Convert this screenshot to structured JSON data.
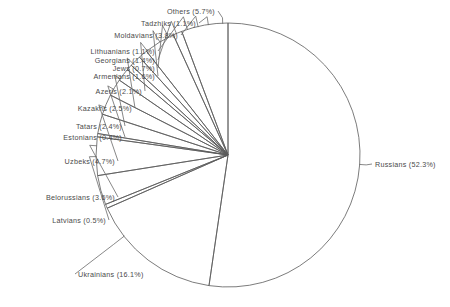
{
  "chart_data": {
    "type": "pie",
    "title": "",
    "subtitle": "",
    "xlabel": "",
    "ylabel": "",
    "legend_position": "none",
    "grid": false,
    "value_unit": "percent",
    "start_angle_deg": 0,
    "direction": "clockwise",
    "total": 100.0,
    "categories": [
      "Russians",
      "Ukrainians",
      "Latvians",
      "Belorussians",
      "Uzbeks",
      "Estonians",
      "Tatars",
      "Kazakhs",
      "Azeris",
      "Armenians",
      "Jews",
      "Georgians",
      "Lithuanians",
      "Moldavians",
      "Tadzhiks",
      "Others"
    ],
    "values": [
      52.3,
      16.1,
      0.5,
      3.6,
      4.7,
      0.4,
      2.4,
      2.5,
      2.1,
      1.6,
      0.7,
      1.4,
      1.1,
      3.8,
      1.1,
      5.7
    ],
    "slices": [
      {
        "label": "Russians",
        "value": 52.3,
        "label_text": "Russians (52.3%)"
      },
      {
        "label": "Ukrainians",
        "value": 16.1,
        "label_text": "Ukrainians (16.1%)"
      },
      {
        "label": "Latvians",
        "value": 0.5,
        "label_text": "Latvians (0.5%)"
      },
      {
        "label": "Belorussians",
        "value": 3.6,
        "label_text": "Belorussians (3.6%)"
      },
      {
        "label": "Uzbeks",
        "value": 4.7,
        "label_text": "Uzbeks (4.7%)"
      },
      {
        "label": "Estonians",
        "value": 0.4,
        "label_text": "Estonians (0.4%)"
      },
      {
        "label": "Tatars",
        "value": 2.4,
        "label_text": "Tatars (2.4%)"
      },
      {
        "label": "Kazakhs",
        "value": 2.5,
        "label_text": "Kazakhs (2.5%)"
      },
      {
        "label": "Azeris",
        "value": 2.1,
        "label_text": "Azeris (2.1%)"
      },
      {
        "label": "Armenians",
        "value": 1.6,
        "label_text": "Armenians (1.6%)"
      },
      {
        "label": "Jews",
        "value": 0.7,
        "label_text": "Jews (0.7%)"
      },
      {
        "label": "Georgians",
        "value": 1.4,
        "label_text": "Georgians (1.4%)"
      },
      {
        "label": "Lithuanians",
        "value": 1.1,
        "label_text": "Lithuanians (1.1%)"
      },
      {
        "label": "Moldavians",
        "value": 3.8,
        "label_text": "Moldavians (3.8%)"
      },
      {
        "label": "Tadzhiks",
        "value": 1.1,
        "label_text": "Tadzhiks (1.1%)"
      },
      {
        "label": "Others",
        "value": 5.7,
        "label_text": "Others (5.7%)"
      }
    ]
  },
  "geometry": {
    "center_x": 228,
    "center_y": 155,
    "radius": 132,
    "stroke_color": "#5a5a5a",
    "fill_color": "#ffffff",
    "label_color": "#4a4a4a"
  },
  "labels": [
    {
      "text": "Others (5.7%)",
      "x": 215,
      "y": 11,
      "anchor": "right",
      "leader_to_r": 1.04,
      "angle_override": 357.7
    },
    {
      "text": "Tadzhiks (1.1%)",
      "x": 196,
      "y": 23,
      "anchor": "right",
      "leader_to_r": 1.06,
      "angle_override": 351.4
    },
    {
      "text": "Moldavians (3.8%)",
      "x": 178,
      "y": 35,
      "anchor": "right",
      "leader_to_r": 1.08,
      "angle_override": 346.9
    },
    {
      "text": "Lithuanians (1.1%)",
      "x": 155,
      "y": 51,
      "anchor": "right",
      "leader_to_r": 1.1,
      "angle_override": 342.1
    },
    {
      "text": "Georgians (1.4%)",
      "x": 155,
      "y": 60,
      "anchor": "right",
      "leader_to_r": 1.1,
      "angle_override": 337.0
    },
    {
      "text": "Jews (0.7%)",
      "x": 155,
      "y": 68,
      "anchor": "right",
      "leader_to_r": 1.1,
      "angle_override": 333.2
    },
    {
      "text": "Armenians (1.6%)",
      "x": 155,
      "y": 76,
      "anchor": "right",
      "leader_to_r": 1.1,
      "angle_override": 328.9
    },
    {
      "text": "Azeris (2.1%)",
      "x": 142,
      "y": 91,
      "anchor": "right",
      "leader_to_r": 1.08,
      "angle_override": 322.2
    },
    {
      "text": "Kazakhs (2.5%)",
      "x": 132,
      "y": 108,
      "anchor": "right",
      "leader_to_r": 1.06,
      "angle_override": 313.9
    },
    {
      "text": "Tatars (2.4%)",
      "x": 122,
      "y": 126,
      "anchor": "right",
      "leader_to_r": 1.05,
      "angle_override": 305.2
    },
    {
      "text": "Estonians (0.4%)",
      "x": 122,
      "y": 137,
      "anchor": "right",
      "leader_to_r": 1.05,
      "angle_override": 299.9
    },
    {
      "text": "Uzbeks (4.7%)",
      "x": 115,
      "y": 161,
      "anchor": "right",
      "leader_to_r": 1.05,
      "angle_override": 291.2
    },
    {
      "text": "Belorussians (3.6%)",
      "x": 115,
      "y": 197,
      "anchor": "right",
      "leader_to_r": 1.05,
      "angle_override": 274.0
    },
    {
      "text": "Latvians (0.5%)",
      "x": 106,
      "y": 220,
      "anchor": "right",
      "leader_to_r": 1.05,
      "angle_override": 269.3
    },
    {
      "text": "Ukrainians (16.1%)",
      "x": 78,
      "y": 274,
      "anchor": "left",
      "leader_to_r": 1.1,
      "angle_override": 232.0
    },
    {
      "text": "Russians (52.3%)",
      "x": 375,
      "y": 164,
      "anchor": "left",
      "leader_to_r": 1.05,
      "angle_override": 94.1
    }
  ]
}
